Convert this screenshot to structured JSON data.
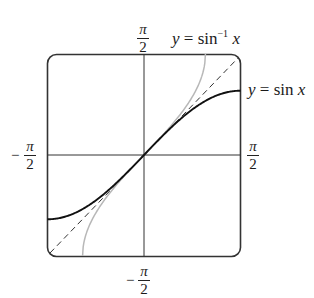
{
  "diagram": {
    "title": "",
    "type": "function-graph",
    "domain_range": {
      "x": [
        "-π/2",
        "π/2"
      ],
      "y": [
        "-π/2",
        "π/2"
      ]
    },
    "labels": {
      "top": {
        "num": "π",
        "den": "2",
        "sign": ""
      },
      "bottom": {
        "num": "π",
        "den": "2",
        "sign": "−"
      },
      "left": {
        "num": "π",
        "den": "2",
        "sign": "−"
      },
      "right": {
        "num": "π",
        "den": "2",
        "sign": ""
      }
    },
    "curves": [
      {
        "name": "sin",
        "label_prefix": "y = sin",
        "label_var": "x",
        "style": "solid",
        "color": "#111111"
      },
      {
        "name": "arcsin",
        "label_prefix": "y = sin",
        "label_sup": "−1",
        "label_var": "x",
        "style": "solid",
        "color": "#b8b8b8"
      },
      {
        "name": "identity",
        "label": "y = x",
        "style": "dashed",
        "color": "#333333"
      }
    ]
  },
  "colors": {
    "frame": "#333333",
    "axes": "#333333",
    "sin": "#111111",
    "arcsin": "#b8b8b8",
    "identity": "#333333"
  }
}
